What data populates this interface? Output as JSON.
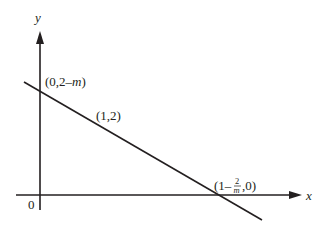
{
  "diagram": {
    "type": "coordinate-graph",
    "axes": {
      "x_label": "x",
      "y_label": "y",
      "origin_label": "0"
    },
    "line": {
      "description": "Line with negative slope through (1,2)"
    },
    "points": {
      "y_intercept": {
        "prefix": "(0,2–",
        "var": "m",
        "suffix": ")"
      },
      "given_point": "(1,2)",
      "x_intercept": {
        "prefix": "(1–",
        "frac_num": "2",
        "frac_den": "m",
        "suffix": ",0)"
      }
    },
    "colors": {
      "stroke": "#231f20",
      "background": "#ffffff"
    }
  }
}
